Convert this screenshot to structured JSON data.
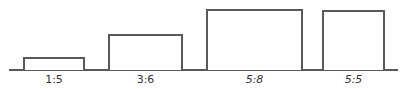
{
  "diagram": {
    "items": [
      {
        "label": "1:5"
      },
      {
        "label": "3:6"
      },
      {
        "label": "5:8"
      },
      {
        "label": "5:5"
      }
    ]
  }
}
